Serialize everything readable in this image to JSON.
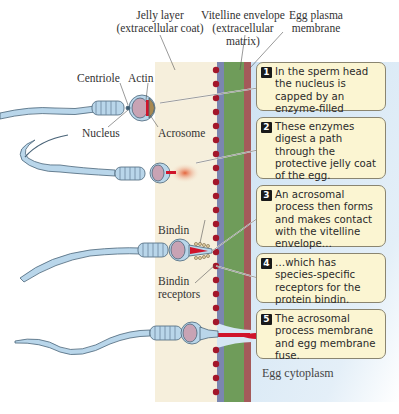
{
  "labels": {
    "jelly_layer": "Jelly layer",
    "jelly_layer_sub": "(extracellular coat)",
    "vitelline": "Vitelline envelope",
    "vitelline_sub1": "(extracellular",
    "vitelline_sub2": "matrix)",
    "egg_membrane1": "Egg plasma",
    "egg_membrane2": "membrane",
    "centriole": "Centriole",
    "actin": "Actin",
    "nucleus": "Nucleus",
    "acrosome": "Acrosome",
    "bindin": "Bindin",
    "bindin_receptors1": "Bindin",
    "bindin_receptors2": "receptors",
    "egg_cytoplasm": "Egg cytoplasm"
  },
  "steps": [
    {
      "num": "1",
      "text": "In the sperm head the nucleus is capped by an enzyme-filled acrosome."
    },
    {
      "num": "2",
      "text": "These enzymes digest a path through the protective jelly coat of the egg."
    },
    {
      "num": "3",
      "text": "An acrosomal process then forms and makes contact with the vitelline envelope…"
    },
    {
      "num": "4",
      "text": "…which has species-specific receptors for the protein bindin."
    },
    {
      "num": "5",
      "text": "The acrosomal process membrane and egg membrane fuse."
    }
  ],
  "colors": {
    "jelly": "#f6efdc",
    "receptor_dot": "#a3162a",
    "vitelline_inner": "#7b86b0",
    "vitelline_green": "#6f9c5a",
    "plasma_membrane": "#a45a5a",
    "cytoplasm": "#d5e6f4",
    "sperm_body": "#b9d6ea",
    "callout_bg": "#fbf5d2"
  }
}
